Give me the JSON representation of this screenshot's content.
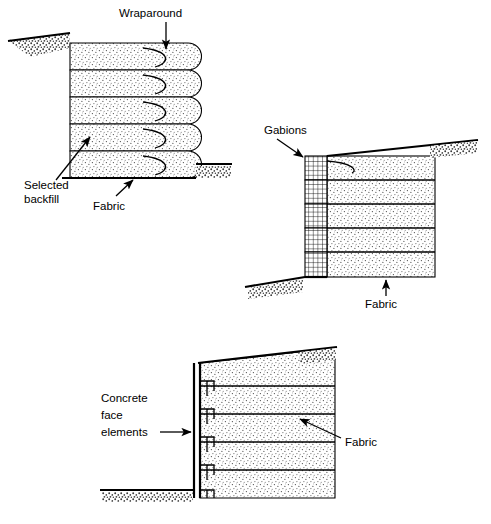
{
  "figure": {
    "panels": [
      {
        "id": "wraparound",
        "name": "Wraparound facing",
        "layer_count": 5,
        "labels": [
          {
            "key": "wraparound",
            "text": "Wraparound",
            "arrow": "down"
          },
          {
            "key": "selected_backfill_line1",
            "text": "Selected",
            "arrow": "up-right"
          },
          {
            "key": "selected_backfill_line2",
            "text": "backfill",
            "arrow": "none"
          },
          {
            "key": "fabric",
            "text": "Fabric",
            "arrow": "up-left"
          }
        ]
      },
      {
        "id": "gabions",
        "name": "Gabion facing",
        "layer_count": 5,
        "labels": [
          {
            "key": "gabions",
            "text": "Gabions",
            "arrow": "down-right"
          },
          {
            "key": "fabric",
            "text": "Fabric",
            "arrow": "up"
          }
        ]
      },
      {
        "id": "concrete",
        "name": "Concrete face element facing",
        "layer_count": 5,
        "labels": [
          {
            "key": "concrete_line1",
            "text": "Concrete",
            "arrow": "none"
          },
          {
            "key": "concrete_line2",
            "text": "face",
            "arrow": "none"
          },
          {
            "key": "concrete_line3",
            "text": "elements",
            "arrow": "right"
          },
          {
            "key": "fabric",
            "text": "Fabric",
            "arrow": "up-left"
          }
        ]
      }
    ],
    "colors": {
      "ink": "#000000",
      "background": "#ffffff",
      "stipple": "#555555"
    }
  }
}
